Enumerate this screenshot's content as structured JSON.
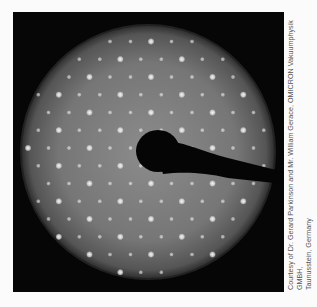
{
  "figure": {
    "credit_line1": "Courtesy of Dr. Gerard Parkinson and Mr. William Gerace, OMICRON Vakuumphysik GMBH,",
    "credit_line2": "Taunusstein, Germany",
    "colors": {
      "background": "#060606",
      "screen_center": "#8a8a8a",
      "screen_edge": "#3a3a3a",
      "spot": "#f2f2f2",
      "gun": "#050505"
    }
  }
}
